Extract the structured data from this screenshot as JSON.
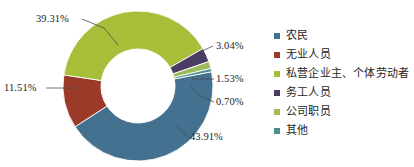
{
  "chart_data": {
    "type": "pie",
    "variant": "donut",
    "title": "",
    "xlabel": "",
    "ylabel": "",
    "units": "percent",
    "legend_position": "right",
    "grid": false,
    "categories": [
      "农民",
      "无业人员",
      "私营企业主、个体劳动者",
      "务工人员",
      "公司职员",
      "其他"
    ],
    "values": [
      43.91,
      11.51,
      39.31,
      3.04,
      1.53,
      0.7
    ],
    "value_labels": [
      "43.91%",
      "11.51%",
      "39.31%",
      "3.04%",
      "1.53%",
      "0.70%"
    ],
    "colors": [
      "#43718F",
      "#9C3A2A",
      "#A7BE38",
      "#4A3C66",
      "#9DBB5B",
      "#4E8F8C"
    ],
    "slices": [
      {
        "label": "农民",
        "value": 43.91,
        "display": "43.91%",
        "color": "#43718F"
      },
      {
        "label": "无业人员",
        "value": 11.51,
        "display": "11.51%",
        "color": "#9C3A2A"
      },
      {
        "label": "私营企业主、个体劳动者",
        "value": 39.31,
        "display": "39.31%",
        "color": "#A7BE38"
      },
      {
        "label": "务工人员",
        "value": 3.04,
        "display": "3.04%",
        "color": "#4A3C66"
      },
      {
        "label": "公司职员",
        "value": 1.53,
        "display": "1.53%",
        "color": "#9DBB5B"
      },
      {
        "label": "其他",
        "value": 0.7,
        "display": "0.70%",
        "color": "#4E8F8C"
      }
    ]
  },
  "legend": {
    "items": [
      {
        "label": "农民",
        "color": "#43718F"
      },
      {
        "label": "无业人员",
        "color": "#9C3A2A"
      },
      {
        "label": "私营企业主、个体劳动者",
        "color": "#A7BE38"
      },
      {
        "label": "务工人员",
        "color": "#4A3C66"
      },
      {
        "label": "公司职员",
        "color": "#9DBB5B"
      },
      {
        "label": "其他",
        "color": "#4E8F8C"
      }
    ]
  },
  "callouts": {
    "farmer": "43.91%",
    "unemployed": "11.51%",
    "private_owner": "39.31%",
    "migrant_worker": "3.04%",
    "company_staff": "1.53%",
    "other": "0.70%"
  }
}
